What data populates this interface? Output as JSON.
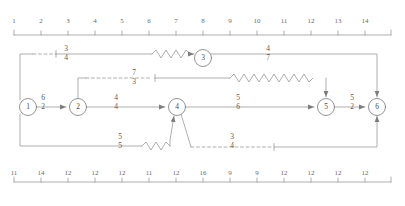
{
  "diagram": {
    "stroke_color": "#808080",
    "node_color": "#6b6b6b",
    "text_color": "#5a5a5a"
  },
  "top_ruler": {
    "name": "top-scale",
    "labels": [
      "1",
      "2",
      "3",
      "4",
      "5",
      "6",
      "7",
      "8",
      "9",
      "10",
      "11",
      "12",
      "13",
      "14"
    ]
  },
  "bottom_ruler": {
    "name": "bottom-scale",
    "labels": [
      "11",
      "14",
      "12",
      "12",
      "12",
      "11",
      "12",
      "16",
      "9",
      "9",
      "12",
      "12",
      "12",
      "12"
    ]
  },
  "nodes": [
    {
      "id": "1",
      "label": "1",
      "cx": 28,
      "cy": 107
    },
    {
      "id": "2",
      "label": "2",
      "cx": 78,
      "cy": 107
    },
    {
      "id": "3",
      "label": "3",
      "cx": 203,
      "cy": 58
    },
    {
      "id": "4",
      "label": "4",
      "cx": 177,
      "cy": 107
    },
    {
      "id": "5",
      "label": "5",
      "cx": 326,
      "cy": 107
    },
    {
      "id": "6",
      "label": "6",
      "cx": 377,
      "cy": 107
    }
  ],
  "edge_labels": [
    {
      "name": "edge-label-top-left",
      "numerator": "3",
      "denominator": "4",
      "x": 66,
      "y": 50
    },
    {
      "name": "edge-label-node3-right",
      "numerator": "4",
      "denominator": "7",
      "x": 268,
      "y": 50
    },
    {
      "name": "edge-label-dashed-mid",
      "numerator": "7",
      "denominator": "3",
      "x": 134,
      "y": 74
    },
    {
      "name": "edge-label-1-to-2",
      "numerator": "6",
      "denominator": "2",
      "x": 43,
      "y": 99
    },
    {
      "name": "edge-label-2-to-4",
      "numerator": "4",
      "denominator": "4",
      "x": 116,
      "y": 99
    },
    {
      "name": "edge-label-4-to-5",
      "numerator": "5",
      "denominator": "6",
      "x": 238,
      "y": 99
    },
    {
      "name": "edge-label-5-to-6",
      "numerator": "5",
      "denominator": "2",
      "x": 339,
      "y": 99
    },
    {
      "name": "edge-label-bottom-left",
      "numerator": "5",
      "denominator": "5",
      "x": 120,
      "y": 138
    },
    {
      "name": "edge-label-bottom-dashed",
      "numerator": "3",
      "denominator": "4",
      "x": 232,
      "y": 138
    }
  ]
}
